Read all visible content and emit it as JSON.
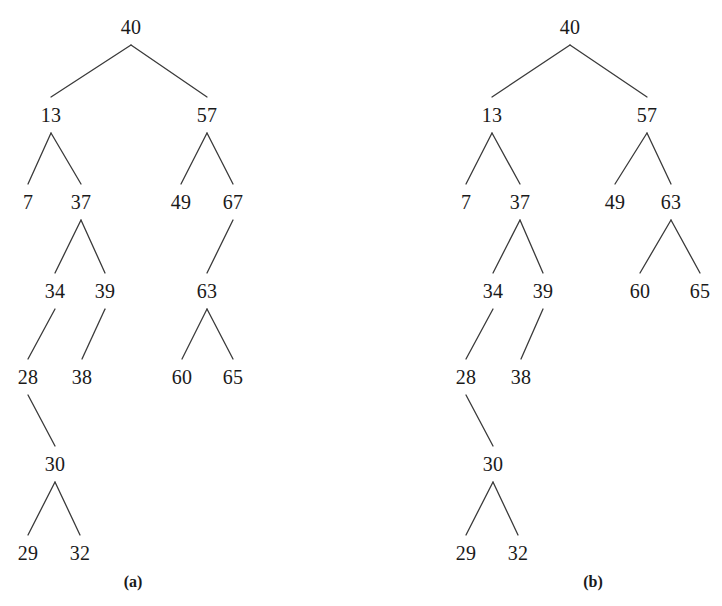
{
  "figure": {
    "width": 722,
    "height": 606,
    "background": "#ffffff",
    "ink_color": "#1a1a1a",
    "edge_color": "#3a3a3a"
  },
  "chart_data": {
    "type": "diagram",
    "subtype": "binary-search-tree-pair",
    "title": "",
    "panels": [
      {
        "caption": "(a)",
        "caption_pos": {
          "x": 133,
          "y": 582
        },
        "root": "40",
        "nodes": [
          {
            "id": "a40",
            "label": "40",
            "x": 131,
            "y": 27,
            "level": 0
          },
          {
            "id": "a13",
            "label": "13",
            "x": 51,
            "y": 115,
            "level": 1
          },
          {
            "id": "a57",
            "label": "57",
            "x": 207,
            "y": 115,
            "level": 1
          },
          {
            "id": "a7",
            "label": "7",
            "x": 28,
            "y": 202,
            "level": 2
          },
          {
            "id": "a37",
            "label": "37",
            "x": 81,
            "y": 202,
            "level": 2
          },
          {
            "id": "a49",
            "label": "49",
            "x": 181,
            "y": 202,
            "level": 2
          },
          {
            "id": "a67",
            "label": "67",
            "x": 233,
            "y": 202,
            "level": 2
          },
          {
            "id": "a34",
            "label": "34",
            "x": 55,
            "y": 291,
            "level": 3
          },
          {
            "id": "a39",
            "label": "39",
            "x": 105,
            "y": 291,
            "level": 3
          },
          {
            "id": "a63",
            "label": "63",
            "x": 207,
            "y": 291,
            "level": 3
          },
          {
            "id": "a28",
            "label": "28",
            "x": 28,
            "y": 377,
            "level": 4
          },
          {
            "id": "a38",
            "label": "38",
            "x": 82,
            "y": 377,
            "level": 4
          },
          {
            "id": "a60",
            "label": "60",
            "x": 182,
            "y": 377,
            "level": 4
          },
          {
            "id": "a65",
            "label": "65",
            "x": 233,
            "y": 377,
            "level": 4
          },
          {
            "id": "a30",
            "label": "30",
            "x": 55,
            "y": 464,
            "level": 5
          },
          {
            "id": "a29",
            "label": "29",
            "x": 28,
            "y": 553,
            "level": 6
          },
          {
            "id": "a32",
            "label": "32",
            "x": 80,
            "y": 553,
            "level": 6
          }
        ],
        "edges": [
          {
            "from": "a40",
            "to": "a13"
          },
          {
            "from": "a40",
            "to": "a57"
          },
          {
            "from": "a13",
            "to": "a7"
          },
          {
            "from": "a13",
            "to": "a37"
          },
          {
            "from": "a57",
            "to": "a49"
          },
          {
            "from": "a57",
            "to": "a67"
          },
          {
            "from": "a37",
            "to": "a34"
          },
          {
            "from": "a37",
            "to": "a39"
          },
          {
            "from": "a67",
            "to": "a63"
          },
          {
            "from": "a34",
            "to": "a28"
          },
          {
            "from": "a39",
            "to": "a38"
          },
          {
            "from": "a63",
            "to": "a60"
          },
          {
            "from": "a63",
            "to": "a65"
          },
          {
            "from": "a28",
            "to": "a30"
          },
          {
            "from": "a30",
            "to": "a29"
          },
          {
            "from": "a30",
            "to": "a32"
          }
        ]
      },
      {
        "caption": "(b)",
        "caption_pos": {
          "x": 593,
          "y": 582
        },
        "root": "40",
        "nodes": [
          {
            "id": "b40",
            "label": "40",
            "x": 570,
            "y": 27,
            "level": 0
          },
          {
            "id": "b13",
            "label": "13",
            "x": 492,
            "y": 115,
            "level": 1
          },
          {
            "id": "b57",
            "label": "57",
            "x": 647,
            "y": 115,
            "level": 1
          },
          {
            "id": "b7",
            "label": "7",
            "x": 466,
            "y": 202,
            "level": 2
          },
          {
            "id": "b37",
            "label": "37",
            "x": 520,
            "y": 202,
            "level": 2
          },
          {
            "id": "b49",
            "label": "49",
            "x": 615,
            "y": 202,
            "level": 2
          },
          {
            "id": "b63",
            "label": "63",
            "x": 671,
            "y": 202,
            "level": 2
          },
          {
            "id": "b34",
            "label": "34",
            "x": 493,
            "y": 291,
            "level": 3
          },
          {
            "id": "b39",
            "label": "39",
            "x": 543,
            "y": 291,
            "level": 3
          },
          {
            "id": "b60",
            "label": "60",
            "x": 640,
            "y": 291,
            "level": 3
          },
          {
            "id": "b65",
            "label": "65",
            "x": 700,
            "y": 291,
            "level": 3
          },
          {
            "id": "b28",
            "label": "28",
            "x": 466,
            "y": 377,
            "level": 4
          },
          {
            "id": "b38",
            "label": "38",
            "x": 521,
            "y": 377,
            "level": 4
          },
          {
            "id": "b30",
            "label": "30",
            "x": 493,
            "y": 464,
            "level": 5
          },
          {
            "id": "b29",
            "label": "29",
            "x": 466,
            "y": 553,
            "level": 6
          },
          {
            "id": "b32",
            "label": "32",
            "x": 518,
            "y": 553,
            "level": 6
          }
        ],
        "edges": [
          {
            "from": "b40",
            "to": "b13"
          },
          {
            "from": "b40",
            "to": "b57"
          },
          {
            "from": "b13",
            "to": "b7"
          },
          {
            "from": "b13",
            "to": "b37"
          },
          {
            "from": "b57",
            "to": "b49"
          },
          {
            "from": "b57",
            "to": "b63"
          },
          {
            "from": "b37",
            "to": "b34"
          },
          {
            "from": "b37",
            "to": "b39"
          },
          {
            "from": "b63",
            "to": "b60"
          },
          {
            "from": "b63",
            "to": "b65"
          },
          {
            "from": "b34",
            "to": "b28"
          },
          {
            "from": "b39",
            "to": "b38"
          },
          {
            "from": "b28",
            "to": "b30"
          },
          {
            "from": "b30",
            "to": "b29"
          },
          {
            "from": "b30",
            "to": "b32"
          }
        ]
      }
    ]
  }
}
